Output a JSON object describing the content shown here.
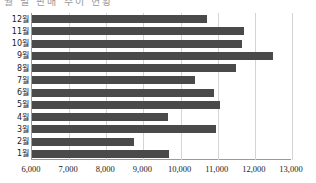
{
  "caption": {
    "text": "월 별 판매 추이 현황"
  },
  "chart_data": {
    "type": "bar",
    "orientation": "horizontal",
    "title": "",
    "subtitle": "",
    "xlabel": "",
    "ylabel": "",
    "categories": [
      "12월",
      "11월",
      "10월",
      "9월",
      "8월",
      "7월",
      "6월",
      "5월",
      "4월",
      "3월",
      "2월",
      "1월"
    ],
    "values": [
      10700,
      11700,
      11650,
      12500,
      11500,
      10400,
      10900,
      11050,
      9650,
      10950,
      8750,
      9700
    ],
    "xlim": [
      6000,
      13000
    ],
    "xticks": [
      6000,
      7000,
      8000,
      9000,
      10000,
      11000,
      12000,
      13000
    ],
    "xtick_labels": [
      "6,000",
      "7,000",
      "8,000",
      "9,000",
      "10,000",
      "11,000",
      "12,000",
      "13,000"
    ],
    "grid": true,
    "grid_axis": "x",
    "legend": false,
    "bar_color": "#4a4a4a",
    "grid_color": "#d4d4d4",
    "axis_color": "#9b9b9b"
  }
}
